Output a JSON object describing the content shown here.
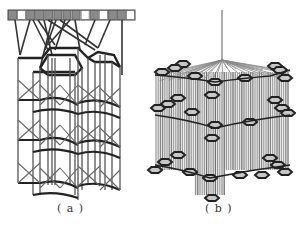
{
  "figure": {
    "panels": [
      {
        "id": "a",
        "label": "( a )",
        "description": "Hexagonal lattice tower structure with top input bar",
        "top_bar_cells": [
          "gray",
          "white",
          "gray",
          "gray",
          "gray",
          "gray",
          "gray",
          "gray",
          "white",
          "gray",
          "white",
          "gray",
          "gray",
          "white"
        ]
      },
      {
        "id": "b",
        "label": "( b )",
        "description": "Suspended hexagonal mesh canopy structure with central hanger"
      }
    ],
    "colors": {
      "dark_line": "#2a2a2a",
      "mid_line": "#6a6a6a",
      "light_line": "#9a9a9a",
      "cell_gray": "#8a8a8a",
      "cell_white": "#ffffff",
      "hex_fill": "#c8c8c8"
    }
  }
}
